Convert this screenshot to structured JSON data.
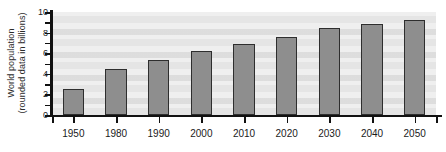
{
  "chart_data": {
    "type": "bar",
    "title": "",
    "subtitle": "",
    "xlabel": "",
    "ylabel": "World population (rounded data in billions)",
    "ylabel_line1": "World population",
    "ylabel_line2": "(rounded data in billions)",
    "categories": [
      "1950",
      "1980",
      "1990",
      "2000",
      "2010",
      "2020",
      "2030",
      "2040",
      "2050"
    ],
    "values": [
      2.5,
      4.5,
      5.3,
      6.2,
      6.9,
      7.6,
      8.4,
      8.8,
      9.2
    ],
    "ylim": [
      0,
      10
    ],
    "ytick_values": [
      0,
      2,
      4,
      6,
      8,
      10
    ],
    "ytick_labels": [
      "0",
      "2",
      "4",
      "6",
      "8",
      "10"
    ],
    "yminor_step": 1,
    "grid": false,
    "legend": null,
    "legend_position": "none",
    "bar_color": "#8e8e8e",
    "bar_edge_color": "#2e2e2e",
    "plot_background": "#efefef",
    "axis_color": "#111111",
    "text_color": "#1a1a1a"
  }
}
